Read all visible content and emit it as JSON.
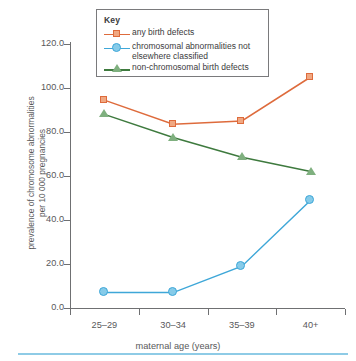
{
  "chart_data": {
    "type": "line",
    "title": "",
    "xlabel": "maternal age (years)",
    "ylabel": "prevalence of chromosome abnormalities\nper 10 000 pregnancies",
    "categories": [
      "25–29",
      "30–34",
      "35–39",
      "40+"
    ],
    "ylim": [
      0,
      120
    ],
    "ytick_values": [
      0,
      20,
      40,
      60,
      80,
      100,
      120
    ],
    "ytick_labels": [
      "0.0",
      "20.0",
      "40.0",
      "60.0",
      "80.0",
      "100.0",
      "120.0"
    ],
    "grid": false,
    "legend_position": "top-center",
    "legend_title": "Key",
    "series": [
      {
        "name": "any birth defects",
        "marker": "square",
        "color": "#de6b3c",
        "fill": "#f0a882",
        "values": [
          94.5,
          83.5,
          85.0,
          105.0
        ]
      },
      {
        "name": "chromosomal abnormalities not\nelsewhere classified",
        "marker": "circle",
        "color": "#3ea7d8",
        "fill": "#86cbe9",
        "values": [
          7.0,
          7.0,
          19.0,
          49.0
        ]
      },
      {
        "name": "non-chromosomal birth defects",
        "marker": "triangle",
        "color": "#3e7a3e",
        "fill": "#7fb07f",
        "values": [
          88.0,
          77.5,
          68.5,
          62.0
        ]
      }
    ]
  },
  "legend": {
    "title": "Key",
    "items": [
      {
        "label": "any birth defects"
      },
      {
        "label": "chromosomal abnormalities not\nelsewhere classified"
      },
      {
        "label": "non-chromosomal birth defects"
      }
    ]
  },
  "axes": {
    "x_label": "maternal age (years)",
    "y_label": "prevalence of chromosome abnormalities\nper 10 000 pregnancies",
    "x_tick_labels": [
      "25–29",
      "30–34",
      "35–39",
      "40+"
    ],
    "y_tick_labels": [
      "120.0",
      "100.0",
      "80.0",
      "60.0",
      "40.0",
      "20.0",
      "0.0"
    ]
  }
}
